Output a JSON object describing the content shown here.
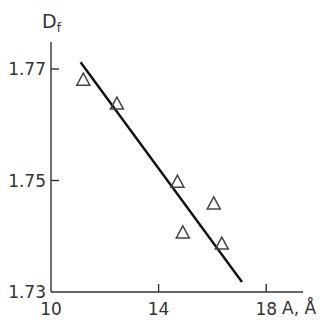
{
  "chart_data": {
    "type": "scatter",
    "title": "",
    "xlabel": "A, Å",
    "ylabel": "D_f",
    "ylabel_main": "D",
    "ylabel_sub": "f",
    "xlim": [
      10,
      19.3
    ],
    "ylim": [
      1.73,
      1.777
    ],
    "x_ticks": [
      "10",
      "14",
      "18"
    ],
    "y_ticks": [
      "1.73",
      "1.75",
      "1.77"
    ],
    "grid": false,
    "legend": null,
    "series": [
      {
        "name": "data",
        "marker": "open-triangle",
        "x": [
          11.2,
          12.45,
          14.7,
          14.9,
          16.05,
          16.35
        ],
        "y": [
          1.768,
          1.7637,
          1.7497,
          1.7406,
          1.7458,
          1.7386
        ]
      },
      {
        "name": "fit",
        "style": "line",
        "x": [
          11.1,
          17.1
        ],
        "y": [
          1.7712,
          1.7318
        ]
      }
    ]
  }
}
